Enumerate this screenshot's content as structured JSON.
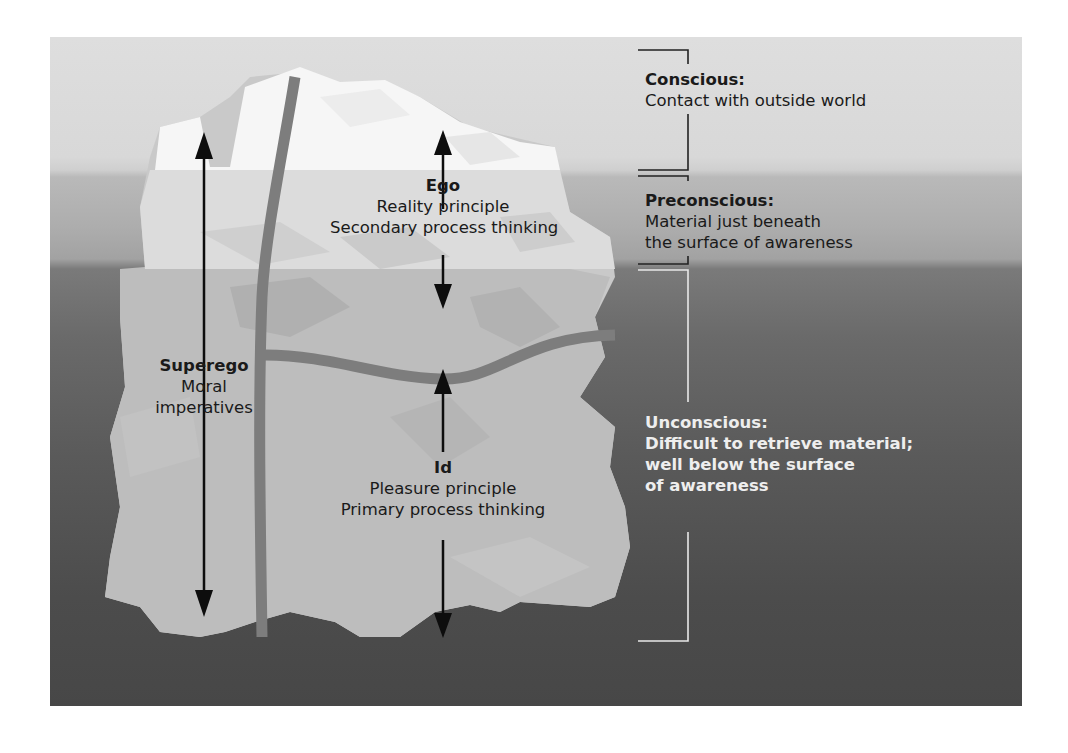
{
  "figure": {
    "type": "iceberg-model-of-mind",
    "colors": {
      "surface_sky": "#dedede",
      "preconscious_band": "#adadad",
      "deep_water": "#4c4c4c",
      "iceberg_top": "#f7f7f7",
      "iceberg_mid": "#dadada",
      "iceberg_under": "#b4b4b4",
      "divider": "#7a7a7a",
      "arrow": "#0d0d0d",
      "bracket_dark": "#222222",
      "bracket_light": "#e8e8e8"
    }
  },
  "structures": {
    "ego": {
      "title": "Ego",
      "lines": [
        "Reality principle",
        "Secondary process thinking"
      ]
    },
    "superego": {
      "title": "Superego",
      "lines": [
        "Moral",
        "imperatives"
      ]
    },
    "id": {
      "title": "Id",
      "lines": [
        "Pleasure principle",
        "Primary process thinking"
      ]
    }
  },
  "levels": {
    "conscious": {
      "title": "Conscious:",
      "lines": [
        "Contact with outside world"
      ]
    },
    "preconscious": {
      "title": "Preconscious:",
      "lines": [
        "Material just beneath",
        "the surface of awareness"
      ]
    },
    "unconscious": {
      "title": "Unconscious:",
      "lines": [
        "Difficult to retrieve material;",
        "well below the surface",
        "of awareness"
      ]
    }
  }
}
